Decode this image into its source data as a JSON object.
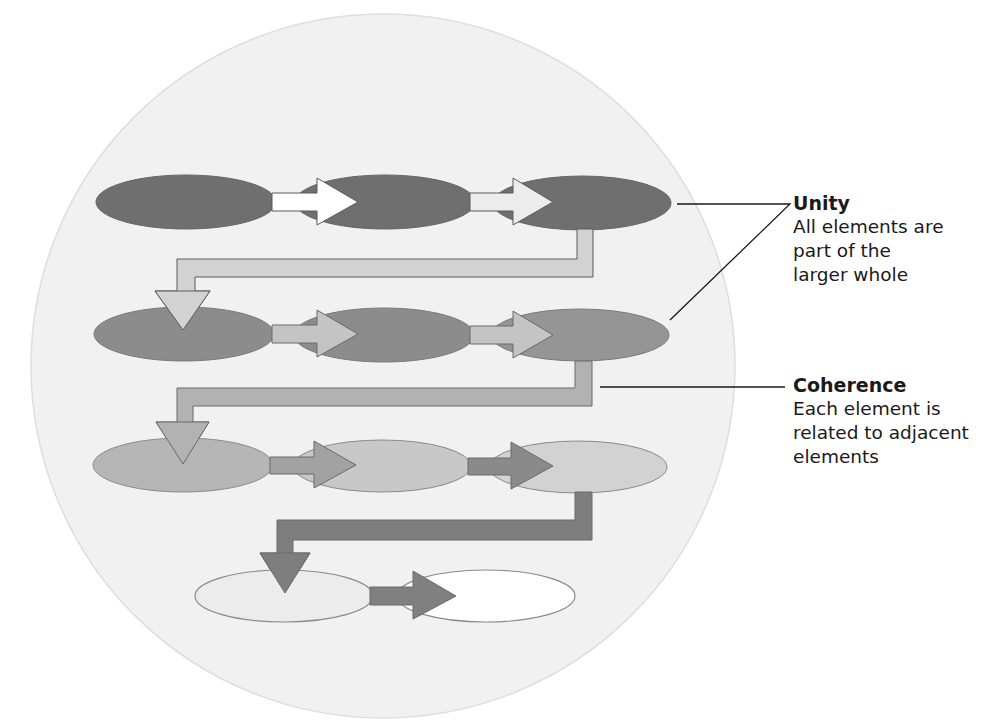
{
  "diagram": {
    "background_circle": {
      "cx": 383,
      "cy": 366,
      "r": 352,
      "fill": "#f1f1f1",
      "stroke": "#dcdcdc"
    },
    "rows": [
      {
        "id": "row-1",
        "ellipse_fill": "#6f6f6f",
        "arrow_fill": "#ffffff",
        "ellipses": [
          {
            "cx": 186,
            "cy": 202,
            "rx": 90,
            "ry": 27
          },
          {
            "cx": 385,
            "cy": 202,
            "rx": 90,
            "ry": 27
          },
          {
            "cx": 582,
            "cy": 203,
            "rx": 89,
            "ry": 27
          }
        ]
      },
      {
        "id": "row-2",
        "ellipse_fill": "#8c8c8c",
        "arrow_fill": "#c4c4c4",
        "ellipses": [
          {
            "cx": 184,
            "cy": 334,
            "rx": 90,
            "ry": 27
          },
          {
            "cx": 384,
            "cy": 335,
            "rx": 90,
            "ry": 27
          },
          {
            "cx": 580,
            "cy": 335,
            "rx": 89,
            "ry": 26
          }
        ]
      },
      {
        "id": "row-3",
        "ellipse_fill_left": "#b4b4b4",
        "ellipse_fill": "#c6c6c6",
        "arrow_fill_left": "#9e9e9e",
        "arrow_fill": "#8a8a8a",
        "ellipses": [
          {
            "cx": 183,
            "cy": 465,
            "rx": 90,
            "ry": 27
          },
          {
            "cx": 382,
            "cy": 466,
            "rx": 89,
            "ry": 26
          },
          {
            "cx": 578,
            "cy": 467,
            "rx": 89,
            "ry": 26
          }
        ]
      },
      {
        "id": "row-4",
        "ellipse_fills": [
          "#e8e8e8",
          "#ffffff"
        ],
        "arrow_fill": "#808080",
        "ellipses": [
          {
            "cx": 284,
            "cy": 596,
            "rx": 89,
            "ry": 26
          },
          {
            "cx": 486,
            "cy": 596,
            "rx": 89,
            "ry": 26
          }
        ]
      }
    ],
    "connectors": [
      {
        "id": "connector-row1-row2",
        "fill": "#d2d2d2"
      },
      {
        "id": "connector-row2-row3",
        "fill": "#b2b2b2"
      },
      {
        "id": "connector-row3-row4",
        "fill": "#7e7e7e"
      }
    ]
  },
  "labels": {
    "unity": {
      "title": "Unity",
      "lines": [
        "All elements are",
        "part of the",
        "larger whole"
      ]
    },
    "coherence": {
      "title": "Coherence",
      "lines": [
        "Each element is",
        "related to adjacent",
        "elements"
      ]
    }
  }
}
